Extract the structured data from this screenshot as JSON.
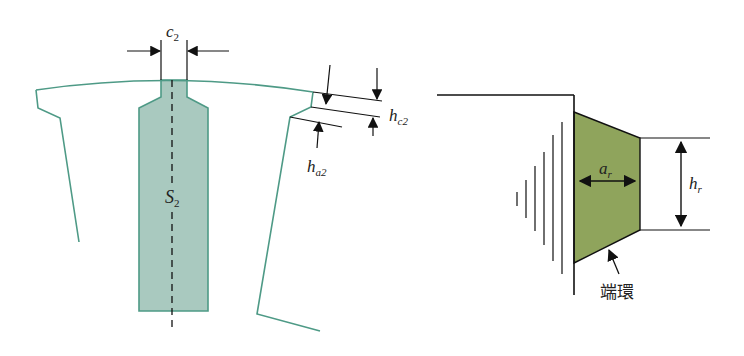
{
  "colors": {
    "outline_teal": "#4e9a86",
    "slot_fill": "#a9c9bf",
    "ring_fill": "#8fa45c",
    "line": "#111111",
    "background": "#ffffff"
  },
  "left_diagram": {
    "title": "rotor slot cross-section",
    "labels": {
      "slot_opening_width": "c",
      "slot_opening_width_sub": "2",
      "slot_area": "S",
      "slot_area_sub": "2",
      "tooth_tip_height": "h",
      "tooth_tip_height_sub": "c2",
      "tooth_wedge_height": "h",
      "tooth_wedge_height_sub": "a2"
    }
  },
  "right_diagram": {
    "title": "end ring cross-section",
    "labels": {
      "ring_width": "a",
      "ring_width_sub": "r",
      "ring_height": "h",
      "ring_height_sub": "r",
      "end_ring": "端環"
    }
  }
}
